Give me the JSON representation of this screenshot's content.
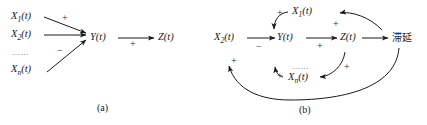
{
  "figure": {
    "panels": [
      {
        "id": "a",
        "caption": "(a)",
        "nodes": [
          {
            "name": "x1",
            "text_base": "X",
            "sub": "1",
            "suffix": "(t)"
          },
          {
            "name": "x2",
            "text_base": "X",
            "sub": "2",
            "suffix": "(t)"
          },
          {
            "name": "ellipsis",
            "text_base": "……"
          },
          {
            "name": "xn",
            "text_base": "X",
            "sub": "n",
            "suffix": "(t)"
          },
          {
            "name": "y",
            "text_base": "Y",
            "sub": "",
            "suffix": "(t)"
          },
          {
            "name": "z",
            "text_base": "Z",
            "sub": "",
            "suffix": "(t)"
          }
        ],
        "edge_signs": [
          "+",
          "−",
          "+"
        ]
      },
      {
        "id": "b",
        "caption": "(b)",
        "nodes": [
          {
            "name": "x2",
            "text_base": "X",
            "sub": "2",
            "suffix": "(t)"
          },
          {
            "name": "x1",
            "text_base": "X",
            "sub": "1",
            "suffix": "(t)"
          },
          {
            "name": "xn",
            "text_base": "X",
            "sub": "n",
            "suffix": "(t)"
          },
          {
            "name": "ellipsis",
            "text_base": "……"
          },
          {
            "name": "y",
            "text_base": "Y",
            "sub": "",
            "suffix": "(t)"
          },
          {
            "name": "z",
            "text_base": "Z",
            "sub": "",
            "suffix": "(t)"
          },
          {
            "name": "delay",
            "text_base": "滞延"
          }
        ],
        "edge_signs": [
          "+",
          "−",
          "+",
          "+",
          "+",
          "+",
          "+"
        ]
      }
    ],
    "signs": {
      "plus": "+",
      "minus": "−"
    },
    "colors": {
      "stroke": "#1a1a1a",
      "text": "#1a1a1a",
      "background": "#ffffff"
    }
  }
}
